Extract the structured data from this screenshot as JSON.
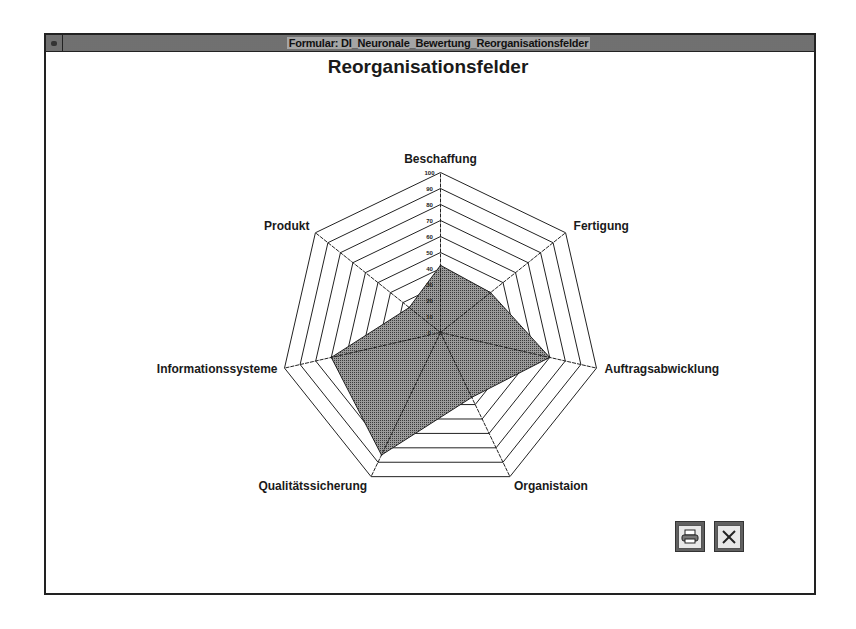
{
  "window": {
    "title": "Formular: DI_Neuronale_Bewertung_Reorganisationsfelder",
    "system_menu_icon": "system-menu-icon"
  },
  "buttons": {
    "print": {
      "icon": "printer-icon",
      "label": "Drucken"
    },
    "close": {
      "icon": "close-icon",
      "label": "Schließen"
    }
  },
  "colors": {
    "fill": "#7a7a7a",
    "grid": "#222222"
  },
  "chart_data": {
    "type": "radar",
    "title": "Reorganisationsfelder",
    "categories": [
      "Beschaffung",
      "Fertigung",
      "Auftragsabwicklung",
      "Organistaion",
      "Qualitätssicherung",
      "Informationssysteme",
      "Produkt"
    ],
    "series": [
      {
        "name": "Bewertung",
        "values": [
          42,
          40,
          70,
          45,
          85,
          70,
          25
        ]
      }
    ],
    "rlim": [
      0,
      100
    ],
    "ticks": [
      0,
      10,
      20,
      30,
      40,
      50,
      60,
      70,
      80,
      90,
      100
    ],
    "tick_labels": [
      "0",
      "10",
      "20",
      "30",
      "40",
      "50",
      "60",
      "70",
      "80",
      "90",
      "100"
    ],
    "grid": true,
    "legend": "none"
  }
}
